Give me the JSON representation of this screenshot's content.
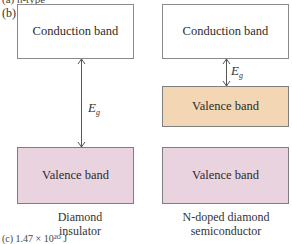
{
  "fragments": {
    "top_cut": "(a) n-type",
    "bottom_cut": "(c) 1.47 × 10²⁰ J"
  },
  "panel_label": "(b)",
  "left": {
    "conduction_label": "Conduction band",
    "gap_symbol": "E",
    "gap_subscript": "g",
    "valence_label": "Valence band",
    "caption_line1": "Diamond",
    "caption_line2": "insulator"
  },
  "right": {
    "conduction_label": "Conduction band",
    "gap_symbol": "E",
    "gap_subscript": "g",
    "donor_valence_label": "Valence band",
    "valence_label": "Valence band",
    "caption_line1": "N-doped diamond",
    "caption_line2": "semiconductor"
  },
  "colors": {
    "valence_pink": "#e9d3de",
    "valence_orange": "#f3d6b4",
    "border": "#8a8a8a"
  }
}
